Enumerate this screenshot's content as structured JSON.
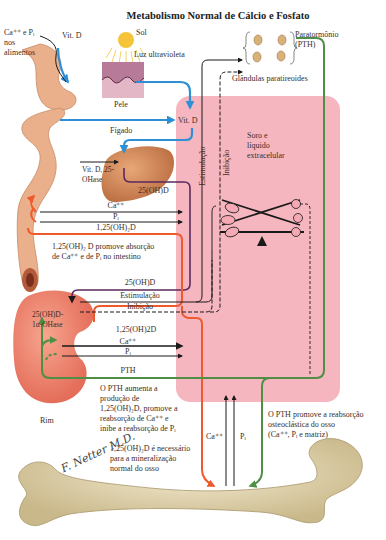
{
  "title": "Metabolismo Normal de Cálcio e Fosfato",
  "sources": {
    "diet": "Ca⁺⁺ e Pᵢ nos alimentos",
    "diet_line1": "Ca⁺⁺ e Pᵢ",
    "diet_line2": "nos",
    "diet_line3": "alimentos",
    "vitd_oral": "Vit. D",
    "sun": "Sol",
    "uv": "Luz ultravioleta",
    "skin": "Pele"
  },
  "parathyroid": {
    "hormone_line1": "Paratormônio",
    "hormone_line2": "(PTH)",
    "glands": "Glândulas paratireoides"
  },
  "liver": {
    "label": "Fígado",
    "enzyme_line1": "Vit. D, 25-",
    "enzyme_line2": "OHase"
  },
  "ecf": {
    "vitd": "Vit. D",
    "label_line1": "Soro e",
    "label_line2": "líquido",
    "label_line3": "extracelular",
    "stimulation_vertical": "Estimulação",
    "inhibition_vertical": "Inibição",
    "balance_left": [
      "Ca",
      "Ca",
      "Ca"
    ],
    "balance_right": [
      "Pᵢ",
      "Pᵢ",
      "Pᵢ"
    ]
  },
  "intestine": {
    "arrow_ca": "Ca⁺⁺",
    "arrow_pi": "Pᵢ",
    "arrow_calcitriol": "1,25(OH)₂D",
    "arrow_25ohd": "25(OH)D",
    "note_line1": "1,25(OH)₂ D promove absorção",
    "note_line2": "de Ca⁺⁺ e de Pᵢ no intestino"
  },
  "kidney": {
    "label": "Rim",
    "enzyme_line1": "25(OH)D-",
    "enzyme_line2": "1α-OHase",
    "arrow_25ohd": "25(OH)D",
    "arrow_stim": "Estimulação",
    "arrow_inhib": "Inibição",
    "arrow_calcitriol": "1,25(OH)2D",
    "arrow_ca": "Ca⁺⁺",
    "arrow_pi": "Pᵢ",
    "arrow_pth": "PTH",
    "note_lines": [
      "O PTH aumenta a",
      "produção de",
      "1,25(OH)₂D, promove a",
      "reabsorção de Ca⁺⁺ e",
      "inibe a reabsorção de Pᵢ"
    ]
  },
  "bone": {
    "arrow_ca": "Ca⁺⁺",
    "arrow_pi": "Pᵢ",
    "pth_note_lines": [
      "O PTH promove a reabsorção",
      "osteoclástica do osso",
      "(Ca⁺⁺, Pᵢ e matriz)"
    ],
    "min_note_lines": [
      "1,25(OH)₂D é necessário",
      "para a mineralização",
      "normal do osso"
    ],
    "signature": "F. Netter M.D."
  },
  "colors": {
    "ecf_pink": "#f4a9b4",
    "vitd_blue": "#2f8fd6",
    "calcitriol_red": "#ee5a2c",
    "pth_green": "#4f8f45",
    "purple_25ohd": "#5a2a5e",
    "black": "#1a1a1a",
    "organ_tan": "#e9b58f",
    "bone": "#e2d6b0"
  }
}
